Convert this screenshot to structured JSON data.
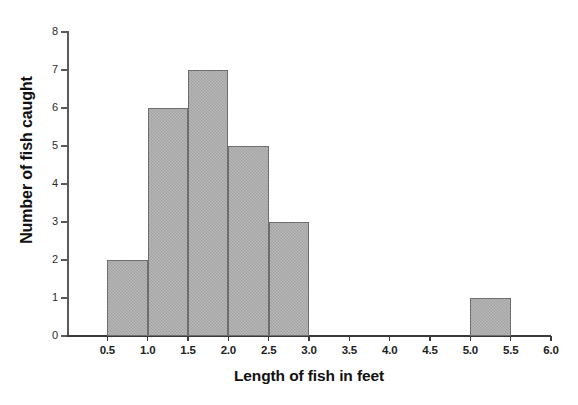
{
  "chart_data": {
    "type": "bar",
    "title": "",
    "subtitle": "",
    "xlabel": "Length of fish in feet",
    "ylabel": "Number of fish caught",
    "bin_edges": [
      0.5,
      1.0,
      1.5,
      2.0,
      2.5,
      3.0,
      5.0,
      5.5
    ],
    "bins": [
      {
        "from": 0.5,
        "to": 1.0,
        "count": 2
      },
      {
        "from": 1.0,
        "to": 1.5,
        "count": 6
      },
      {
        "from": 1.5,
        "to": 2.0,
        "count": 7
      },
      {
        "from": 2.0,
        "to": 2.5,
        "count": 5
      },
      {
        "from": 2.5,
        "to": 3.0,
        "count": 3
      },
      {
        "from": 5.0,
        "to": 5.5,
        "count": 1
      }
    ],
    "categories": [
      "0.5-1.0",
      "1.0-1.5",
      "1.5-2.0",
      "2.0-2.5",
      "2.5-3.0",
      "3.0-3.5",
      "3.5-4.0",
      "4.0-4.5",
      "4.5-5.0",
      "5.0-5.5",
      "5.5-6.0"
    ],
    "values": [
      2,
      6,
      7,
      5,
      3,
      0,
      0,
      0,
      0,
      1,
      0
    ],
    "xlim": [
      0.0,
      6.0
    ],
    "ylim": [
      0,
      8
    ],
    "xticks": [
      "0.5",
      "1.0",
      "1.5",
      "2.0",
      "2.5",
      "3.0",
      "3.5",
      "4.0",
      "4.5",
      "5.0",
      "5.5",
      "6.0"
    ],
    "xtick_values": [
      0.5,
      1.0,
      1.5,
      2.0,
      2.5,
      3.0,
      3.5,
      4.0,
      4.5,
      5.0,
      5.5,
      6.0
    ],
    "yticks": [
      "0",
      "1",
      "2",
      "3",
      "4",
      "5",
      "6",
      "7",
      "8"
    ],
    "ytick_values": [
      0,
      1,
      2,
      3,
      4,
      5,
      6,
      7,
      8
    ],
    "grid": false,
    "legend": false,
    "legend_position": "none",
    "bar_fill_color": "#aaaaaa",
    "bar_border_color": "#6e6e6e",
    "axis_color": "#3a3a3a",
    "background_color": "#ffffff",
    "total_fish": 24
  }
}
